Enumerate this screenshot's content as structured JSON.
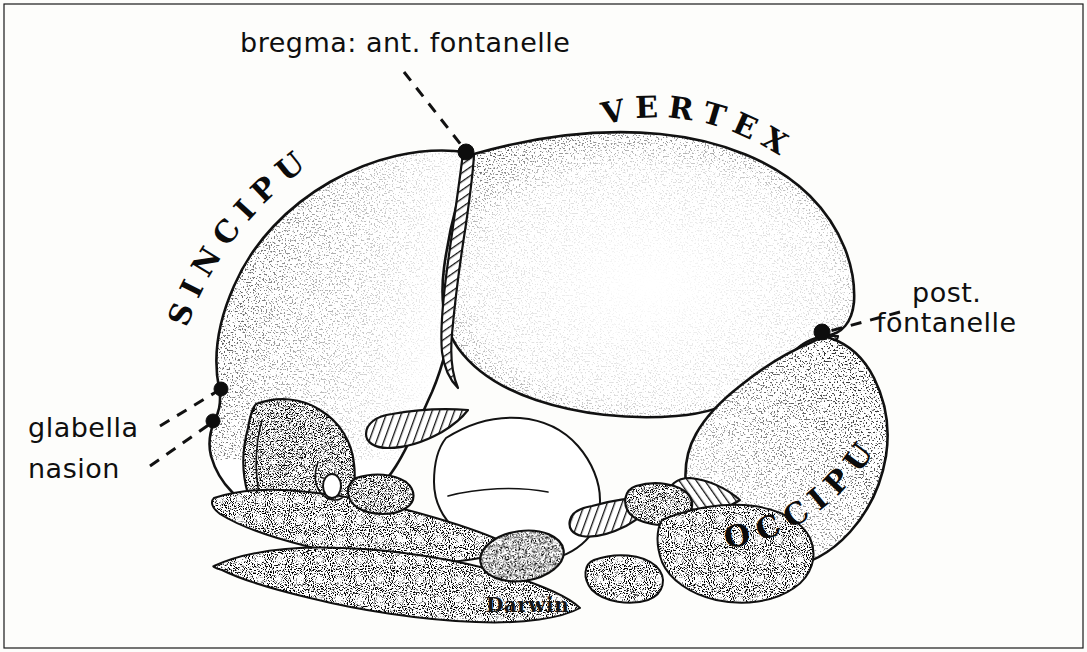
{
  "figure": {
    "medium": "pen-and-ink-stipple-drawing",
    "background_color": "#fdfdfb",
    "ink_color": "#121212",
    "signature": "Darwin"
  },
  "labels": {
    "bregma": {
      "text": "bregma: ant. fontanelle",
      "style": "lowercase-script",
      "x": 240,
      "y": 52,
      "leader": "dashed",
      "points_to": "bregma-point"
    },
    "post_fontanelle_line1": {
      "text": "post.",
      "style": "lowercase-script",
      "x": 912,
      "y": 302
    },
    "post_fontanelle_line2": {
      "text": "fontanelle",
      "style": "lowercase-script",
      "x": 876,
      "y": 332,
      "leader": "dashed",
      "points_to": "posterior-fontanelle-point"
    },
    "glabella": {
      "text": "glabella",
      "style": "lowercase-script",
      "x": 28,
      "y": 437,
      "leader": "dashed",
      "points_to": "glabella-point"
    },
    "nasion": {
      "text": "nasion",
      "style": "lowercase-script",
      "x": 28,
      "y": 478,
      "leader": "dashed",
      "points_to": "nasion-point"
    },
    "sinciput": {
      "text": "SINCIPUT",
      "style": "spaced-capitals-curved",
      "region": "frontal-anterior-superior"
    },
    "vertex": {
      "text": "VERTEX",
      "style": "spaced-capitals-curved",
      "region": "cranial-vault-top"
    },
    "occiput": {
      "text": "OCCIPUT",
      "style": "spaced-capitals-curved",
      "region": "posterior-inferior"
    }
  },
  "anatomy_points": {
    "bregma": {
      "x": 466,
      "y": 152
    },
    "posterior_fontanelle": {
      "x": 822,
      "y": 332
    },
    "glabella": {
      "x": 222,
      "y": 388
    },
    "nasion": {
      "x": 214,
      "y": 420
    }
  },
  "colors": {
    "ink": "#121212",
    "paper": "#fdfdfb",
    "dark_fill": "#1d1d1d"
  }
}
